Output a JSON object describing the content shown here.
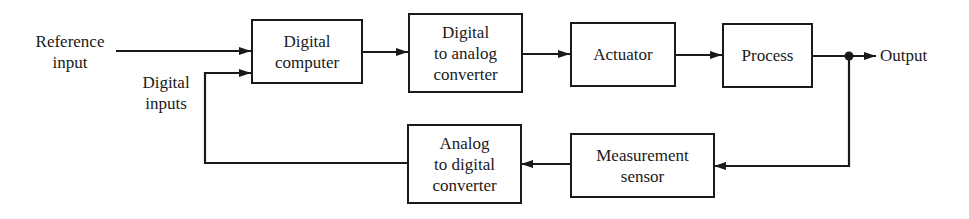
{
  "diagram": {
    "type": "block-diagram",
    "title": "",
    "blocks": {
      "digital_computer": "Digital\ncomputer",
      "dac": "Digital\nto analog\nconverter",
      "actuator": "Actuator",
      "process": "Process",
      "sensor": "Measurement\nsensor",
      "adc": "Analog\nto digital\nconverter"
    },
    "labels": {
      "reference_input": "Reference\ninput",
      "digital_inputs": "Digital\ninputs",
      "output": "Output"
    },
    "connections": [
      {
        "from": "reference_input",
        "to": "digital_computer"
      },
      {
        "from": "adc",
        "to": "digital_computer",
        "label": "digital_inputs"
      },
      {
        "from": "digital_computer",
        "to": "dac"
      },
      {
        "from": "dac",
        "to": "actuator"
      },
      {
        "from": "actuator",
        "to": "process"
      },
      {
        "from": "process",
        "to": "output"
      },
      {
        "from": "output",
        "to": "sensor"
      },
      {
        "from": "sensor",
        "to": "adc"
      }
    ],
    "colors": {
      "line": "#1a1a1a",
      "background": "#ffffff"
    }
  }
}
